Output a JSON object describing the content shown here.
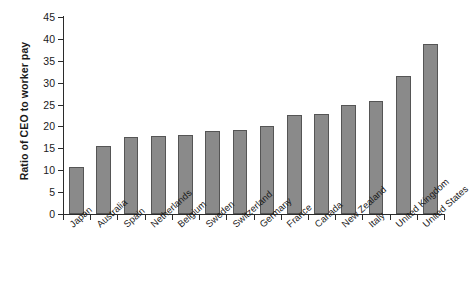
{
  "chart_data": {
    "type": "bar",
    "title": "",
    "xlabel": "",
    "ylabel": "Ratio of CEO to worker pay",
    "ylim": [
      0,
      45
    ],
    "ytick_step": 5,
    "yticks": [
      0,
      5,
      10,
      15,
      20,
      25,
      30,
      35,
      40,
      45
    ],
    "grid": false,
    "legend": false,
    "bar_color": "#8a8a8a",
    "bar_edge_color": "#555555",
    "axis_color": "#2b2b2b",
    "categories": [
      "Japan",
      "Australia",
      "Spain",
      "Netherlands",
      "Belgium",
      "Sweden",
      "Switzerland",
      "Germany",
      "France",
      "Canada",
      "New Zealand",
      "Italy",
      "United Kingdom",
      "United States"
    ],
    "values": [
      10.8,
      15.6,
      17.5,
      17.8,
      18.0,
      19.0,
      19.2,
      20.2,
      22.6,
      22.9,
      24.9,
      25.9,
      31.5,
      38.8
    ]
  }
}
